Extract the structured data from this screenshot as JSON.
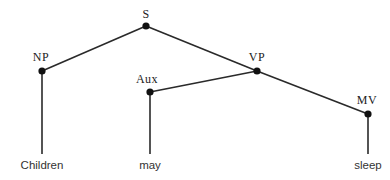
{
  "diagram": {
    "type": "syntax-tree",
    "nodes": {
      "S": {
        "label": "S",
        "x": 146,
        "y": 26,
        "label_x": 146,
        "label_y": 14
      },
      "NP": {
        "label": "NP",
        "x": 42,
        "y": 71,
        "label_x": 41,
        "label_y": 57
      },
      "VP": {
        "label": "VP",
        "x": 257,
        "y": 71,
        "label_x": 257,
        "label_y": 57
      },
      "Aux": {
        "label": "Aux",
        "x": 150,
        "y": 92,
        "label_x": 147,
        "label_y": 79
      },
      "MV": {
        "label": "MV",
        "x": 368,
        "y": 114,
        "label_x": 367,
        "label_y": 100
      }
    },
    "leaves": {
      "children": {
        "text": "Children",
        "x": 42,
        "line_end_y": 154,
        "label_y": 165
      },
      "may": {
        "text": "may",
        "x": 150,
        "line_end_y": 154,
        "label_y": 165
      },
      "sleep": {
        "text": "sleep",
        "x": 368,
        "line_end_y": 154,
        "label_y": 165
      }
    },
    "edges": [
      [
        "S",
        "NP"
      ],
      [
        "S",
        "VP"
      ],
      [
        "VP",
        "Aux"
      ],
      [
        "VP",
        "MV"
      ],
      [
        "NP",
        "children"
      ],
      [
        "Aux",
        "may"
      ],
      [
        "MV",
        "sleep"
      ]
    ],
    "colors": {
      "line": "#2a2a2a",
      "dot": "#111111",
      "text": "#222222"
    }
  }
}
